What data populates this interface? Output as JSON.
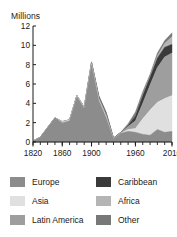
{
  "chart_data": {
    "type": "area",
    "stacked": true,
    "title": "",
    "subtitle": "",
    "unit_label": "Millions",
    "xlabel": "",
    "ylabel": "Millions",
    "xlim": [
      1820,
      2010
    ],
    "ylim": [
      0,
      12
    ],
    "yticks": [
      0,
      2,
      4,
      6,
      8,
      10,
      12
    ],
    "ytick_labels": [
      "0",
      "2",
      "4",
      "6",
      "8",
      "10",
      "12"
    ],
    "xticks": [
      1820,
      1860,
      1900,
      1960,
      2010
    ],
    "xtick_labels": [
      "1820",
      "1860",
      "1900",
      "1960",
      "2010"
    ],
    "x_minor_tick_interval": 10,
    "grid": false,
    "legend_position": "below",
    "x": [
      1820,
      1830,
      1840,
      1850,
      1860,
      1870,
      1880,
      1890,
      1900,
      1910,
      1920,
      1930,
      1940,
      1950,
      1960,
      1970,
      1980,
      1990,
      2000,
      2010
    ],
    "series": [
      {
        "name": "Europe",
        "color": "#8c8c8c",
        "values": [
          0.1,
          0.5,
          1.5,
          2.5,
          2.0,
          2.2,
          4.7,
          3.5,
          8.0,
          4.3,
          2.5,
          0.3,
          0.9,
          1.1,
          1.0,
          0.8,
          0.7,
          1.3,
          1.0,
          1.1
        ]
      },
      {
        "name": "Asia",
        "color": "#e0e0e0",
        "values": [
          0.0,
          0.0,
          0.0,
          0.0,
          0.1,
          0.1,
          0.1,
          0.1,
          0.1,
          0.1,
          0.1,
          0.0,
          0.0,
          0.2,
          0.4,
          1.6,
          2.6,
          2.8,
          3.5,
          3.7
        ]
      },
      {
        "name": "Latin America",
        "color": "#9e9e9e",
        "values": [
          0.0,
          0.0,
          0.0,
          0.0,
          0.0,
          0.0,
          0.0,
          0.0,
          0.1,
          0.2,
          0.3,
          0.1,
          0.1,
          0.3,
          0.8,
          1.6,
          2.6,
          3.6,
          4.3,
          4.4
        ]
      },
      {
        "name": "Caribbean",
        "color": "#3a3a3a",
        "values": [
          0.0,
          0.0,
          0.0,
          0.0,
          0.0,
          0.0,
          0.0,
          0.0,
          0.0,
          0.1,
          0.1,
          0.0,
          0.0,
          0.1,
          0.5,
          0.8,
          0.8,
          1.0,
          1.0,
          0.9
        ]
      },
      {
        "name": "Africa",
        "color": "#b5b5b5",
        "values": [
          0.0,
          0.0,
          0.0,
          0.0,
          0.0,
          0.0,
          0.0,
          0.0,
          0.0,
          0.0,
          0.0,
          0.0,
          0.0,
          0.0,
          0.0,
          0.1,
          0.1,
          0.2,
          0.4,
          0.8
        ]
      },
      {
        "name": "Other",
        "color": "#787878",
        "values": [
          0.0,
          0.0,
          0.0,
          0.0,
          0.0,
          0.0,
          0.0,
          0.0,
          0.1,
          0.1,
          0.1,
          0.0,
          0.0,
          0.2,
          0.4,
          0.3,
          0.2,
          0.3,
          0.3,
          0.4
        ]
      }
    ]
  },
  "legend": {
    "columns": [
      {
        "entries": [
          {
            "label": "Europe",
            "color": "#8c8c8c"
          },
          {
            "label": "Asia",
            "color": "#e0e0e0"
          },
          {
            "label": "Latin America",
            "color": "#9e9e9e"
          }
        ]
      },
      {
        "entries": [
          {
            "label": "Caribbean",
            "color": "#3a3a3a"
          },
          {
            "label": "Africa",
            "color": "#b5b5b5"
          },
          {
            "label": "Other",
            "color": "#787878"
          }
        ]
      }
    ]
  }
}
